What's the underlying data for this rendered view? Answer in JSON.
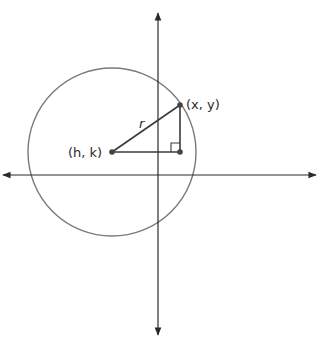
{
  "diagram": {
    "type": "circle-on-coordinate-plane",
    "colors": {
      "axis": "#2a2a2a",
      "circle": "#7a7a7a",
      "segments": "#3a3a3a",
      "points": "#444444"
    },
    "labels": {
      "center": "(h, k)",
      "point": "(x, y)",
      "radius": "r"
    }
  }
}
